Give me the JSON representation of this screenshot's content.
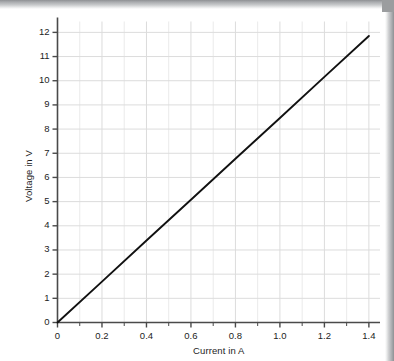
{
  "chart_data": {
    "type": "line",
    "title": "",
    "xlabel": "Current in A",
    "ylabel": "Voltage in V",
    "xlim": [
      0,
      1.45
    ],
    "ylim": [
      0,
      12.45
    ],
    "grid": true,
    "legend": "none",
    "xticks": [
      0,
      0.2,
      0.4,
      0.6,
      0.8,
      1.0,
      1.2,
      1.4
    ],
    "xtick_labels": [
      "0",
      "0.2",
      "0.4",
      "0.6",
      "0.8",
      "1.0",
      "1.2",
      "1.4"
    ],
    "xtick_minor_step": 0.1,
    "yticks": [
      0,
      1,
      2,
      3,
      4,
      5,
      6,
      7,
      8,
      9,
      10,
      11,
      12
    ],
    "ytick_labels": [
      "0",
      "1",
      "2",
      "3",
      "4",
      "5",
      "6",
      "7",
      "8",
      "9",
      "10",
      "11",
      "12"
    ],
    "series": [
      {
        "name": "Voltage vs Current",
        "color": "#111111",
        "x": [
          0,
          0.2,
          0.4,
          0.6,
          0.8,
          1.0,
          1.2,
          1.4
        ],
        "values": [
          0,
          1.69,
          3.39,
          5.08,
          6.77,
          8.46,
          10.16,
          11.85
        ]
      }
    ],
    "slope": 8.46,
    "intercept": 0
  },
  "axis": {
    "x_title": "Current in A",
    "y_title": "Voltage in V"
  },
  "colors": {
    "line": "#111111",
    "grid": "#dcdcdc",
    "grid_minor": "#e8e8e8",
    "spine": "#4a4a4a",
    "text": "#1d1d1d",
    "background": "#ffffff",
    "page_edge": "#9b9d9f"
  }
}
